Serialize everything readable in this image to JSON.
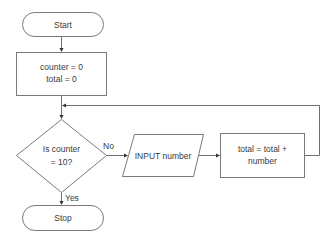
{
  "diagram": {
    "type": "flowchart",
    "nodes": {
      "start": {
        "shape": "terminator",
        "label": "Start"
      },
      "init": {
        "shape": "process",
        "lines": [
          "counter = 0",
          "total = 0"
        ]
      },
      "decision": {
        "shape": "decision",
        "lines": [
          "Is counter",
          "= 10?"
        ]
      },
      "input": {
        "shape": "input-output",
        "label": "INPUT number"
      },
      "accumulate": {
        "shape": "process",
        "lines": [
          "total = total +",
          "number"
        ]
      },
      "stop": {
        "shape": "terminator",
        "label": "Stop"
      }
    },
    "edges": {
      "no_label": "No",
      "yes_label": "Yes"
    },
    "connections": [
      {
        "from": "start",
        "to": "init"
      },
      {
        "from": "init",
        "to": "decision"
      },
      {
        "from": "decision",
        "to": "input",
        "label": "No"
      },
      {
        "from": "input",
        "to": "accumulate"
      },
      {
        "from": "accumulate",
        "to": "decision",
        "note": "loop back"
      },
      {
        "from": "decision",
        "to": "stop",
        "label": "Yes"
      }
    ]
  }
}
